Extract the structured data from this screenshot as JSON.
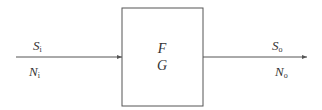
{
  "diagram": {
    "type": "block-diagram",
    "colors": {
      "stroke": "#555555",
      "text": "#333333",
      "background": "#ffffff"
    },
    "input": {
      "signal": {
        "symbol": "S",
        "subscript": "i"
      },
      "noise": {
        "symbol": "N",
        "subscript": "i"
      }
    },
    "block": {
      "line1": "F",
      "line2": "G"
    },
    "output": {
      "signal": {
        "symbol": "S",
        "subscript": "o"
      },
      "noise": {
        "symbol": "N",
        "subscript": "o"
      }
    }
  }
}
